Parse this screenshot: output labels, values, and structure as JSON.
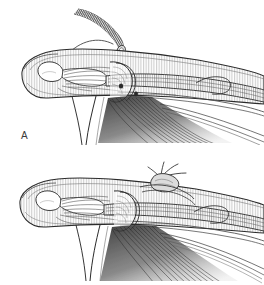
{
  "figure": {
    "kind": "surgical-illustration",
    "style": "pen-and-ink line drawing, grayscale hatching",
    "background_color": "#ffffff",
    "ink_color": "#2b2b2b",
    "shade_color": "#8d8d8d",
    "light_shade_color": "#c9c9c9",
    "width": 264,
    "height": 285
  },
  "panels": [
    {
      "id": "a",
      "label": "A",
      "label_x": 21,
      "label_y": 131,
      "caption_text": "A",
      "description": "Free tendon graft strip being delivered toward the distal phalanx; curved arrow indicates direction of passage.",
      "elements": [
        {
          "name": "tendon-graft-strip",
          "description": "Curved hatched tendon graft held above the finger"
        },
        {
          "name": "direction-arrow",
          "description": "Thin curved arrow sweeping from left up to graft tip"
        },
        {
          "name": "finger-outline",
          "description": "Lateral profile of fingertip and pulp"
        },
        {
          "name": "distal-phalanx-bone",
          "description": "Outlined distal phalanx with tuft"
        },
        {
          "name": "flexor-tendon-bundle",
          "description": "Fanned flexor tendon fibers running proximally"
        },
        {
          "name": "pulley-band",
          "description": "Annular pulley encircling the tendon"
        },
        {
          "name": "shaded-tendon-fan",
          "description": "Dark hatched fan of tendon fibers below the digit"
        }
      ]
    },
    {
      "id": "b",
      "label": "B",
      "label_x": 23,
      "label_y": 252,
      "caption_text": "B",
      "description": "Graft secured in place with a suture knot over the distal phalanx; knot tails visible dorsally.",
      "elements": [
        {
          "name": "suture-knot",
          "description": "Tied knot with fanned suture tails on the dorsal aspect"
        },
        {
          "name": "finger-outline",
          "description": "Lateral profile of fingertip and pulp"
        },
        {
          "name": "distal-phalanx-bone",
          "description": "Outlined distal phalanx with tuft"
        },
        {
          "name": "flexor-tendon-bundle",
          "description": "Fanned flexor tendon fibers running proximally"
        },
        {
          "name": "pulley-band",
          "description": "Annular pulley encircling the tendon"
        },
        {
          "name": "shaded-tendon-fan",
          "description": "Dark hatched fan of tendon fibers below the digit"
        }
      ]
    }
  ]
}
